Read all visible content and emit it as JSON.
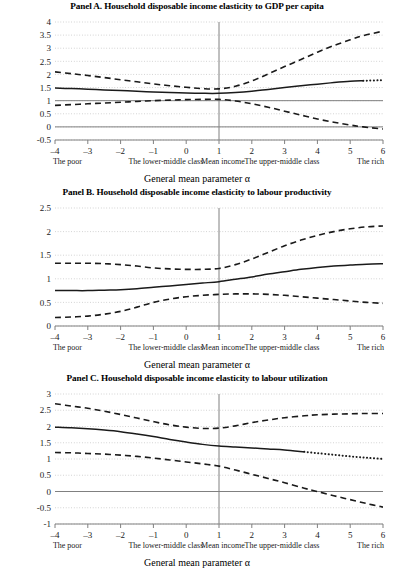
{
  "figure": {
    "axis_title": "General mean parameter α",
    "category_labels": [
      {
        "text": "The poor",
        "x": -3.62
      },
      {
        "text": "The lower-middle class",
        "x": -0.62
      },
      {
        "text": "Mean income",
        "x": 1.12
      },
      {
        "text": "The upper-middle class",
        "x": 2.92
      },
      {
        "text": "The rich",
        "x": 5.62
      }
    ],
    "xticks": [
      "-4",
      "-3",
      "-2",
      "-1",
      "0",
      "1",
      "2",
      "3",
      "4",
      "5",
      "6"
    ],
    "colors": {
      "line": "#1a1a1a",
      "grid": "#b3b3b3",
      "axis": "#808080",
      "reference": "#808080"
    }
  },
  "chart_data": [
    {
      "type": "line",
      "panel": "A",
      "title": "Panel A. Household disposable income elasticity to GDP per capita",
      "xlabel": "General mean parameter α",
      "ylabel": "",
      "xlim": [
        -4,
        6
      ],
      "ylim": [
        -0.5,
        4
      ],
      "yticks": [
        -0.5,
        0,
        0.5,
        1,
        1.5,
        2,
        2.5,
        3,
        3.5,
        4
      ],
      "ytick_labels": [
        "-0.5",
        "0",
        "0.5",
        "1",
        "1.5",
        "2",
        "2.5",
        "3",
        "3.5",
        "4"
      ],
      "xticks": [
        -4,
        -3,
        -2,
        -1,
        0,
        1,
        2,
        3,
        4,
        5,
        6
      ],
      "grid": true,
      "reference_lines": {
        "horizontal": [
          0,
          1
        ],
        "vertical": [
          1
        ]
      },
      "x": [
        -4,
        -3.5,
        -3,
        -2.5,
        -2,
        -1.5,
        -1,
        -0.5,
        0,
        0.5,
        1,
        1.5,
        2,
        2.5,
        3,
        3.5,
        4,
        4.5,
        5,
        5.4,
        6
      ],
      "series": [
        {
          "name": "point estimate",
          "style": "solid",
          "dotted_from_x": 5.4,
          "values": [
            1.48,
            1.46,
            1.44,
            1.41,
            1.39,
            1.36,
            1.33,
            1.31,
            1.29,
            1.28,
            1.28,
            1.31,
            1.36,
            1.43,
            1.5,
            1.57,
            1.63,
            1.69,
            1.74,
            1.76,
            1.78
          ]
        },
        {
          "name": "upper confidence band",
          "style": "dashed",
          "values": [
            2.1,
            2.03,
            1.96,
            1.88,
            1.8,
            1.72,
            1.64,
            1.57,
            1.51,
            1.46,
            1.45,
            1.55,
            1.75,
            2.02,
            2.3,
            2.57,
            2.85,
            3.1,
            3.32,
            3.48,
            3.65
          ]
        },
        {
          "name": "lower confidence band",
          "style": "dashed",
          "values": [
            0.82,
            0.85,
            0.88,
            0.91,
            0.94,
            0.97,
            1.0,
            1.02,
            1.04,
            1.05,
            1.05,
            0.99,
            0.88,
            0.75,
            0.6,
            0.45,
            0.3,
            0.18,
            0.07,
            0.0,
            -0.08
          ]
        }
      ]
    },
    {
      "type": "line",
      "panel": "B",
      "title": "Panel B. Household disposable income elasticity to labour productivity",
      "xlabel": "General mean parameter α",
      "ylabel": "",
      "xlim": [
        -4,
        6
      ],
      "ylim": [
        0,
        2.5
      ],
      "yticks": [
        0,
        0.5,
        1,
        1.5,
        2,
        2.5
      ],
      "ytick_labels": [
        "0",
        "0.5",
        "1",
        "1.5",
        "2",
        "2.5"
      ],
      "xticks": [
        -4,
        -3,
        -2,
        -1,
        0,
        1,
        2,
        3,
        4,
        5,
        6
      ],
      "grid": true,
      "reference_lines": {
        "horizontal": [],
        "vertical": [
          1
        ]
      },
      "x": [
        -4,
        -3.5,
        -3,
        -2.5,
        -2,
        -1.5,
        -1,
        -0.5,
        0,
        0.5,
        1,
        1.5,
        2,
        2.5,
        3,
        3.5,
        4,
        4.5,
        5,
        5.5,
        6
      ],
      "series": [
        {
          "name": "point estimate",
          "style": "solid",
          "values": [
            0.75,
            0.75,
            0.75,
            0.76,
            0.77,
            0.79,
            0.82,
            0.85,
            0.88,
            0.91,
            0.94,
            0.99,
            1.04,
            1.1,
            1.15,
            1.2,
            1.24,
            1.27,
            1.29,
            1.31,
            1.32
          ]
        },
        {
          "name": "upper confidence band",
          "style": "dashed",
          "values": [
            1.33,
            1.33,
            1.33,
            1.32,
            1.3,
            1.27,
            1.23,
            1.21,
            1.2,
            1.2,
            1.22,
            1.3,
            1.42,
            1.56,
            1.7,
            1.82,
            1.92,
            2.0,
            2.06,
            2.1,
            2.12
          ]
        },
        {
          "name": "lower confidence band",
          "style": "dashed",
          "values": [
            0.18,
            0.19,
            0.21,
            0.25,
            0.31,
            0.4,
            0.5,
            0.57,
            0.62,
            0.65,
            0.67,
            0.68,
            0.68,
            0.67,
            0.65,
            0.62,
            0.59,
            0.56,
            0.53,
            0.5,
            0.48
          ]
        }
      ]
    },
    {
      "type": "line",
      "panel": "C",
      "title": "Panel C. Household disposable income elasticity to labour utilization",
      "xlabel": "General mean parameter α",
      "ylabel": "",
      "xlim": [
        -4,
        6
      ],
      "ylim": [
        -1,
        3
      ],
      "yticks": [
        -1,
        -0.5,
        0,
        0.5,
        1,
        1.5,
        2,
        2.5,
        3
      ],
      "ytick_labels": [
        "-1",
        "-0.5",
        "0",
        "0.5",
        "1",
        "1.5",
        "2",
        "2.5",
        "3"
      ],
      "xticks": [
        -4,
        -3,
        -2,
        -1,
        0,
        1,
        2,
        3,
        4,
        5,
        6
      ],
      "grid": true,
      "reference_lines": {
        "horizontal": [
          0
        ],
        "vertical": [
          1
        ]
      },
      "x": [
        -4,
        -3.5,
        -3,
        -2.5,
        -2,
        -1.5,
        -1,
        -0.5,
        0,
        0.5,
        1,
        1.5,
        2,
        2.5,
        3,
        3.6,
        4,
        4.5,
        5,
        5.5,
        6
      ],
      "series": [
        {
          "name": "point estimate",
          "style": "solid",
          "dotted_from_x": 3.6,
          "values": [
            1.98,
            1.96,
            1.93,
            1.89,
            1.84,
            1.77,
            1.69,
            1.6,
            1.52,
            1.45,
            1.4,
            1.37,
            1.34,
            1.31,
            1.28,
            1.22,
            1.18,
            1.13,
            1.08,
            1.04,
            1.0
          ]
        },
        {
          "name": "upper confidence band",
          "style": "dashed",
          "values": [
            2.7,
            2.63,
            2.56,
            2.47,
            2.37,
            2.26,
            2.15,
            2.05,
            1.98,
            1.94,
            1.95,
            2.02,
            2.12,
            2.2,
            2.27,
            2.33,
            2.36,
            2.38,
            2.39,
            2.4,
            2.4
          ]
        },
        {
          "name": "lower confidence band",
          "style": "dashed",
          "values": [
            1.2,
            1.19,
            1.17,
            1.15,
            1.12,
            1.08,
            1.03,
            0.97,
            0.91,
            0.85,
            0.78,
            0.66,
            0.53,
            0.4,
            0.27,
            0.1,
            0.0,
            -0.13,
            -0.25,
            -0.37,
            -0.48
          ]
        }
      ]
    }
  ]
}
